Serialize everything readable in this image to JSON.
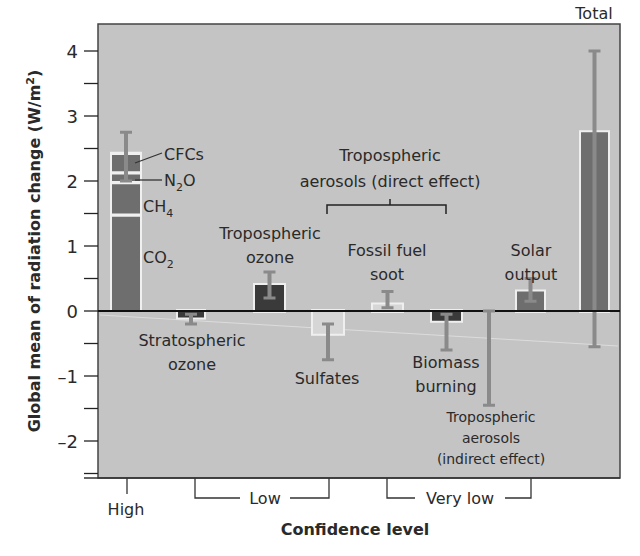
{
  "chart_data": {
    "type": "bar",
    "title": "",
    "xlabel": "Confidence level",
    "ylabel": "Global mean of radiation change (W/m²)",
    "ylabel_parts": {
      "main": "Global mean of radiation change (W/m",
      "sup": "2",
      "end": ")"
    },
    "ylim": [
      -2.5,
      4.45
    ],
    "yticks_major": [
      -2,
      -1,
      0,
      1,
      2,
      3,
      4
    ],
    "yticks_minor": [
      -2.5,
      -1.5,
      -0.5,
      0.5,
      1.5,
      2.5,
      3.5
    ],
    "ytick_labels": [
      "–2",
      "–1",
      "0",
      "1",
      "2",
      "3",
      "4"
    ],
    "grid": false,
    "legend": null,
    "colors": {
      "plot_bg": "#c4c4c4",
      "bar_mid": "#6e6e6e",
      "bar_dark": "#3a3a3a",
      "bar_light": "#d6d6d6",
      "errorbar": "#8a8a8a",
      "axis": "#222222"
    },
    "series": [
      {
        "name": "Greenhouse gases",
        "category": "High",
        "stack": [
          {
            "name": "CO₂",
            "from": 0,
            "to": 1.45
          },
          {
            "name": "CH₄",
            "from": 1.5,
            "to": 1.95
          },
          {
            "name": "N₂O",
            "from": 2.0,
            "to": 2.1
          },
          {
            "name": "CFCs",
            "from": 2.15,
            "to": 2.4
          }
        ],
        "value": 2.45,
        "error": [
          2.0,
          2.75
        ]
      },
      {
        "name": "Stratospheric ozone",
        "category": "Low",
        "value": -0.1,
        "error": [
          -0.2,
          -0.05
        ]
      },
      {
        "name": "Tropospheric ozone",
        "category": "Low",
        "value": 0.4,
        "error": [
          0.2,
          0.6
        ]
      },
      {
        "name": "Sulfates",
        "category": "Low",
        "value": -0.35,
        "error": [
          -0.75,
          -0.2
        ]
      },
      {
        "name": "Fossil fuel soot",
        "category": "Very low",
        "value": 0.1,
        "error": [
          0.05,
          0.3
        ]
      },
      {
        "name": "Biomass burning",
        "category": "Very low",
        "value": -0.15,
        "error": [
          -0.6,
          -0.05
        ]
      },
      {
        "name": "Tropospheric aerosols (indirect effect)",
        "category": "Very low",
        "value": 0,
        "error": [
          -1.45,
          0
        ]
      },
      {
        "name": "Solar output",
        "category": "Very low",
        "value": 0.3,
        "error": [
          0.15,
          0.5
        ]
      },
      {
        "name": "Total",
        "category": "",
        "value": 2.75,
        "error": [
          -0.55,
          4.0
        ]
      }
    ],
    "confidence_groups": [
      {
        "label": "High"
      },
      {
        "label": "Low"
      },
      {
        "label": "Very low"
      }
    ],
    "annotations": {
      "cfcs": "CFCs",
      "n2o_main": "N",
      "n2o_sub": "2",
      "n2o_end": "O",
      "ch4_main": "CH",
      "ch4_sub": "4",
      "co2_main": "CO",
      "co2_sub": "2",
      "trop_ozone_1": "Tropospheric",
      "trop_ozone_2": "ozone",
      "strat_ozone_1": "Stratospheric",
      "strat_ozone_2": "ozone",
      "aero_direct_1": "Tropospheric",
      "aero_direct_2": "aerosols (direct effect)",
      "soot_1": "Fossil fuel",
      "soot_2": "soot",
      "sulfates": "Sulfates",
      "biomass_1": "Biomass",
      "biomass_2": "burning",
      "aero_indirect_1": "Tropospheric",
      "aero_indirect_2": "aerosols",
      "aero_indirect_3": "(indirect effect)",
      "solar_1": "Solar",
      "solar_2": "output",
      "total": "Total"
    }
  }
}
